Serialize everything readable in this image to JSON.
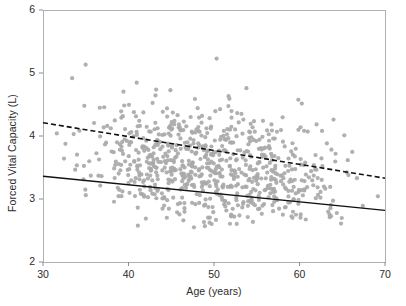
{
  "chart_data": {
    "type": "scatter",
    "title": "",
    "xlabel": "Age (years)",
    "ylabel": "Forced Vital Capacity (L)",
    "xlim": [
      30,
      70
    ],
    "ylim": [
      2,
      6
    ],
    "xticks": [
      30,
      40,
      50,
      60,
      70
    ],
    "yticks": [
      2,
      3,
      4,
      5,
      6
    ],
    "grid": false,
    "legend": "none",
    "marker": {
      "color": "#a9a9a9",
      "shape": "circle",
      "size_px": 4.2,
      "opacity": 0.92
    },
    "n_points": 760,
    "point_cloud": {
      "description": "Dense cloud of individual subjects, forced vital capacity declining with age",
      "x_range": [
        30,
        70
      ],
      "y_center_at_x30": 3.82,
      "y_center_at_x70": 3.08,
      "y_spread_sd": 0.42,
      "y_clip": [
        2.55,
        5.95
      ],
      "density_peak_band": [
        3.1,
        4.2
      ]
    },
    "series": [
      {
        "name": "upper-percentile-line",
        "style": "dashed",
        "color": "#111111",
        "width_px": 1.6,
        "x": [
          30,
          70
        ],
        "y": [
          4.21,
          3.33
        ]
      },
      {
        "name": "lower-percentile-line",
        "style": "solid",
        "color": "#111111",
        "width_px": 1.4,
        "x": [
          30,
          70
        ],
        "y": [
          3.36,
          2.82
        ]
      }
    ],
    "axis": {
      "frame_color": "#b0b0b0",
      "tick_color": "#8c8c8c",
      "background": "#ffffff"
    }
  },
  "plot_box": {
    "left": 43,
    "right": 385,
    "top": 10,
    "bottom": 262
  }
}
